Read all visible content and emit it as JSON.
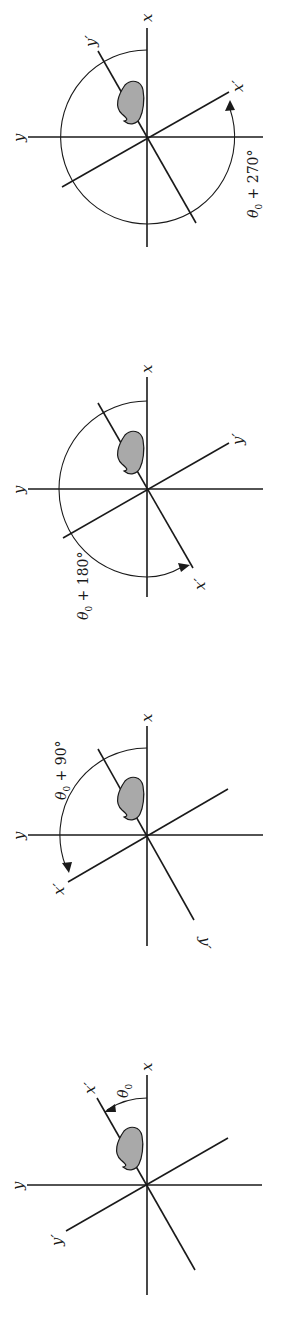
{
  "figure": {
    "orientation": "rotated 90 degrees (landscape figure printed sideways)",
    "colors": {
      "line": "#1a1a1a",
      "shape_fill": "#a9a9a9",
      "background": "#ffffff"
    }
  },
  "panels": [
    {
      "id": "panel-270",
      "labels": {
        "x": "x",
        "y": "y",
        "x_prime": "x′",
        "y_prime": "y′"
      },
      "angle_label": {
        "theta": "θ",
        "sub": "0",
        "rest": " + 270°"
      },
      "arc": "full-circle-270"
    },
    {
      "id": "panel-180",
      "labels": {
        "x": "x",
        "y": "y",
        "x_prime": "x′",
        "y_prime": "y′"
      },
      "angle_label": {
        "theta": "θ",
        "sub": "0",
        "rest": " + 180°"
      },
      "arc": "half-circle-180"
    },
    {
      "id": "panel-90",
      "labels": {
        "x": "x",
        "y": "y",
        "x_prime": "x′",
        "y_prime": "y′"
      },
      "angle_label": {
        "theta": "θ",
        "sub": "0",
        "rest": " + 90°"
      },
      "arc": "quarter-arc-90"
    },
    {
      "id": "panel-0",
      "labels": {
        "x": "x",
        "y": "y",
        "x_prime": "x′",
        "y_prime": "y′"
      },
      "angle_label": {
        "theta": "θ",
        "sub": "0",
        "rest": ""
      },
      "arc": "small-arc-theta0"
    }
  ]
}
